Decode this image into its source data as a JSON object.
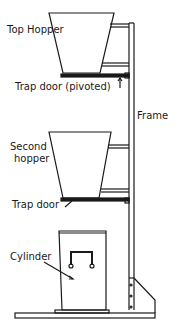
{
  "diagram": {
    "labels": {
      "top_hopper": "Top Hopper",
      "trap_door_pivoted": "Trap door (pivoted)",
      "frame": "Frame",
      "second_hopper_line1": "Second",
      "second_hopper_line2": "hopper",
      "trap_door": "Trap door",
      "cylinder": "Cylinder"
    },
    "colors": {
      "line": "#1a1a1a",
      "background": "#ffffff"
    }
  }
}
